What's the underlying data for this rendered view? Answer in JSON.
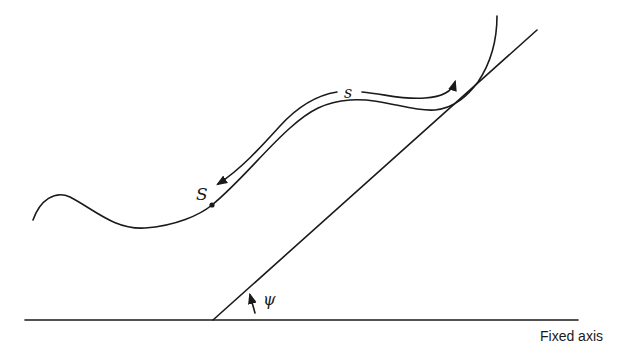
{
  "diagram": {
    "labels": {
      "arc_length": "s",
      "reference_point": "S",
      "angle": "ψ",
      "axis": "Fixed axis"
    },
    "elements": {
      "curve": "plane curve",
      "tangent_line": "tangent at point",
      "fixed_axis": "horizontal reference axis",
      "angle_arrow": "angle ψ between tangent and axis"
    },
    "colors": {
      "ink": "#1a1a1a",
      "background": "#ffffff"
    }
  }
}
